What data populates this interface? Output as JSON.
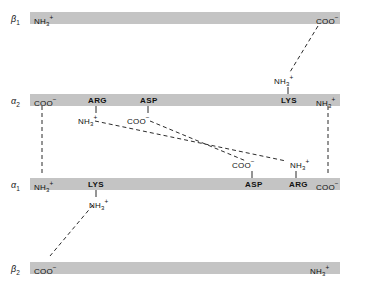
{
  "figure": {
    "background_color": "#ffffff",
    "bar_color": "#c4c4c4",
    "line_color": "#2b2b2b"
  },
  "chains": [
    {
      "id": "beta1",
      "label": "β",
      "sub": "1",
      "bar": {
        "x": 30,
        "y": 12,
        "width": 310,
        "height": 12
      },
      "label_pos": {
        "x": 11,
        "y": 12
      },
      "termini": [
        {
          "name": "n-terminus",
          "text": "NH",
          "sub": "3",
          "sup": "+",
          "x": 34,
          "y": 12
        },
        {
          "name": "c-terminus",
          "text": "COO",
          "sub": "",
          "sup": "−",
          "x": 316,
          "y": 12
        }
      ],
      "residues": []
    },
    {
      "id": "alpha2",
      "label": "α",
      "sub": "2",
      "bar": {
        "x": 30,
        "y": 94,
        "width": 310,
        "height": 12
      },
      "label_pos": {
        "x": 11,
        "y": 94
      },
      "termini": [
        {
          "name": "n-terminus",
          "text": "COO",
          "sub": "",
          "sup": "−",
          "x": 34,
          "y": 94
        },
        {
          "name": "c-terminus",
          "text": "NH",
          "sub": "3",
          "sup": "+",
          "x": 316,
          "y": 94
        }
      ],
      "residues": [
        {
          "name": "arg",
          "text": "ARG",
          "x": 88,
          "y": 94,
          "group": {
            "text": "NH",
            "sub": "3",
            "sup": "+",
            "x": 78,
            "y": 114
          }
        },
        {
          "name": "asp",
          "text": "ASP",
          "x": 140,
          "y": 94,
          "group": {
            "text": "COO",
            "sub": "",
            "sup": "−",
            "x": 127,
            "y": 114
          }
        },
        {
          "name": "lys",
          "text": "LYS",
          "x": 281,
          "y": 94,
          "group": {
            "text": "NH",
            "sub": "3",
            "sup": "+",
            "x": 274,
            "y": 74
          }
        }
      ]
    },
    {
      "id": "alpha1",
      "label": "α",
      "sub": "1",
      "bar": {
        "x": 30,
        "y": 178,
        "width": 310,
        "height": 12
      },
      "label_pos": {
        "x": 11,
        "y": 178
      },
      "termini": [
        {
          "name": "n-terminus",
          "text": "NH",
          "sub": "3",
          "sup": "+",
          "x": 34,
          "y": 178
        },
        {
          "name": "c-terminus",
          "text": "COO",
          "sub": "",
          "sup": "−",
          "x": 316,
          "y": 178
        }
      ],
      "residues": [
        {
          "name": "lys",
          "text": "LYS",
          "x": 88,
          "y": 178,
          "group": {
            "text": "NH",
            "sub": "3",
            "sup": "+",
            "x": 89,
            "y": 198
          }
        },
        {
          "name": "asp",
          "text": "ASP",
          "x": 245,
          "y": 178,
          "group": {
            "text": "COO",
            "sub": "",
            "sup": "−",
            "x": 232,
            "y": 158
          }
        },
        {
          "name": "arg",
          "text": "ARG",
          "x": 289,
          "y": 178,
          "group": {
            "text": "NH",
            "sub": "3",
            "sup": "+",
            "x": 290,
            "y": 158
          }
        }
      ]
    },
    {
      "id": "beta2",
      "label": "β",
      "sub": "2",
      "bar": {
        "x": 30,
        "y": 262,
        "width": 310,
        "height": 12
      },
      "label_pos": {
        "x": 11,
        "y": 262
      },
      "termini": [
        {
          "name": "n-terminus",
          "text": "COO",
          "sub": "",
          "sup": "−",
          "x": 34,
          "y": 262
        },
        {
          "name": "c-terminus",
          "text": "NH",
          "sub": "3",
          "sup": "+",
          "x": 310,
          "y": 262
        }
      ],
      "residues": []
    }
  ],
  "stems": [
    {
      "name": "stem-alpha2-arg",
      "x1": 96,
      "y1": 106,
      "x2": 96,
      "y2": 113
    },
    {
      "name": "stem-alpha2-asp",
      "x1": 148,
      "y1": 106,
      "x2": 148,
      "y2": 113
    },
    {
      "name": "stem-alpha2-lys",
      "x1": 288,
      "y1": 94,
      "x2": 288,
      "y2": 87
    },
    {
      "name": "stem-alpha1-lys",
      "x1": 96,
      "y1": 190,
      "x2": 96,
      "y2": 197
    },
    {
      "name": "stem-alpha1-asp",
      "x1": 252,
      "y1": 178,
      "x2": 252,
      "y2": 171
    },
    {
      "name": "stem-alpha1-arg",
      "x1": 296,
      "y1": 178,
      "x2": 296,
      "y2": 171
    }
  ],
  "salt_bridges": [
    {
      "name": "bridge-beta1-coo-to-alpha2-lys",
      "x1": 318,
      "y1": 26,
      "x2": 290,
      "y2": 72,
      "from": "β1 COO−",
      "to": "α2 LYS NH3+"
    },
    {
      "name": "bridge-alpha2-coo-to-alpha1-nh3",
      "x1": 42,
      "y1": 106,
      "x2": 42,
      "y2": 176,
      "from": "α2 COO−",
      "to": "α1 NH3+"
    },
    {
      "name": "bridge-alpha2-nh3-to-alpha1-coo",
      "x1": 328,
      "y1": 106,
      "x2": 328,
      "y2": 176,
      "from": "α2 NH3+",
      "to": "α1 COO−"
    },
    {
      "name": "bridge-alpha2-arg-to-alpha1-arg",
      "x1": 95,
      "y1": 121,
      "x2": 286,
      "y2": 161,
      "from": "α2 ARG NH3+",
      "to": "α1 ARG NH3+"
    },
    {
      "name": "bridge-alpha2-asp-to-alpha1-asp",
      "x1": 150,
      "y1": 121,
      "x2": 246,
      "y2": 161,
      "from": "α2 ASP COO−",
      "to": "α1 ASP COO−"
    },
    {
      "name": "bridge-alpha1-lys-to-beta2-coo",
      "x1": 93,
      "y1": 205,
      "x2": 50,
      "y2": 256,
      "from": "α1 LYS NH3+",
      "to": "β2 COO−"
    }
  ]
}
